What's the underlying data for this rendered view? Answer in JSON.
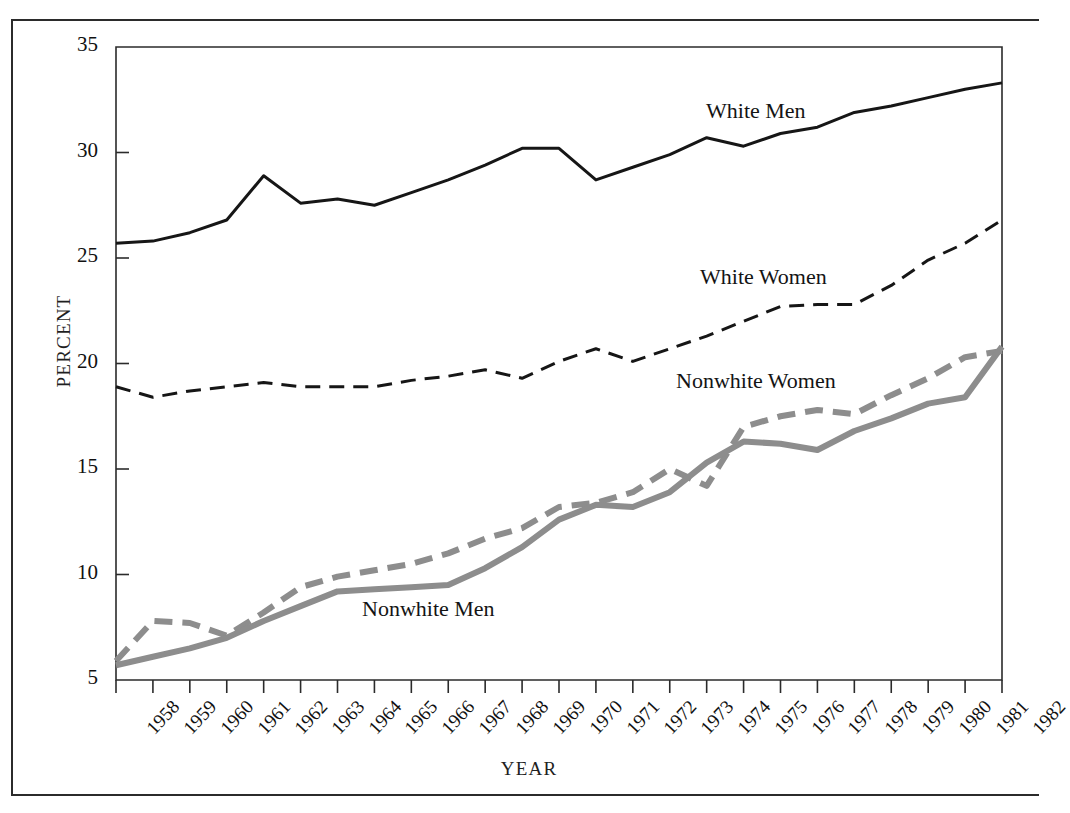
{
  "figure": {
    "top_caption": "",
    "ylabel": "PERCENT",
    "xlabel": "YEAR"
  },
  "colors": {
    "white_series": "#161616",
    "nonwhite_series": "#8d8d8d",
    "frame": "#2b2b2b",
    "background": "#ffffff"
  },
  "labels": {
    "white_men": "White Men",
    "white_women": "White Women",
    "nonwhite_women": "Nonwhite Women",
    "nonwhite_men": "Nonwhite Men"
  },
  "chart_data": {
    "type": "line",
    "title": "",
    "subtitle": "",
    "xlabel": "YEAR",
    "ylabel": "PERCENT",
    "grid": false,
    "legend_position": "inline-annotations",
    "xlim": [
      1958,
      1982
    ],
    "ylim": [
      5,
      35
    ],
    "ytick_labels": [
      "5",
      "10",
      "15",
      "20",
      "25",
      "30",
      "35"
    ],
    "yticks": [
      5,
      10,
      15,
      20,
      25,
      30,
      35
    ],
    "x": [
      1958,
      1959,
      1960,
      1961,
      1962,
      1963,
      1964,
      1965,
      1966,
      1967,
      1968,
      1969,
      1970,
      1971,
      1972,
      1973,
      1974,
      1975,
      1976,
      1977,
      1978,
      1979,
      1980,
      1981,
      1982
    ],
    "xtick_labels": [
      "1958",
      "1959",
      "1960",
      "1961",
      "1962",
      "1963",
      "1964",
      "1965",
      "1966",
      "1967",
      "1968",
      "1969",
      "1970",
      "1971",
      "1972",
      "1973",
      "1974",
      "1975",
      "1976",
      "1977",
      "1978",
      "1979",
      "1980",
      "1981",
      "1982"
    ],
    "series": [
      {
        "name": "White Men",
        "style": "solid",
        "color": "#161616",
        "values": [
          25.7,
          25.8,
          26.2,
          26.8,
          28.9,
          27.6,
          27.8,
          27.5,
          28.1,
          28.7,
          29.4,
          30.2,
          30.2,
          28.7,
          29.3,
          29.9,
          30.7,
          30.3,
          30.9,
          31.2,
          31.9,
          32.2,
          32.6,
          33.0,
          33.3
        ]
      },
      {
        "name": "White Women",
        "style": "dashed",
        "color": "#161616",
        "values": [
          18.9,
          18.4,
          18.7,
          18.9,
          19.1,
          18.9,
          18.9,
          18.9,
          19.2,
          19.4,
          19.7,
          19.3,
          20.1,
          20.7,
          20.1,
          20.7,
          21.3,
          22.0,
          22.7,
          22.8,
          22.8,
          23.7,
          24.9,
          25.7,
          26.8
        ]
      },
      {
        "name": "Nonwhite Women",
        "style": "dashed",
        "color": "#8d8d8d",
        "values": [
          5.9,
          7.8,
          7.7,
          7.1,
          8.2,
          9.4,
          9.9,
          10.2,
          10.5,
          11.0,
          11.7,
          12.2,
          13.2,
          13.4,
          13.9,
          15.0,
          14.2,
          17.0,
          17.5,
          17.8,
          17.6,
          18.5,
          19.3,
          20.3,
          20.6
        ]
      },
      {
        "name": "Nonwhite Men",
        "style": "solid",
        "color": "#8d8d8d",
        "values": [
          5.7,
          6.1,
          6.5,
          7.0,
          7.8,
          8.5,
          9.2,
          9.3,
          9.4,
          9.5,
          10.3,
          11.3,
          12.6,
          13.3,
          13.2,
          13.9,
          15.3,
          16.3,
          16.2,
          15.9,
          16.8,
          17.4,
          18.1,
          18.4,
          20.8
        ]
      }
    ]
  }
}
